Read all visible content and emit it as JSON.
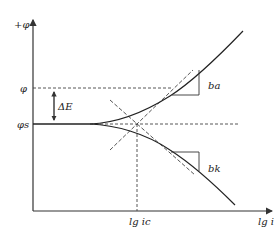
{
  "diagram": {
    "type": "polarization-curve (Tafel plot)",
    "y_axis": {
      "label": "+φ"
    },
    "x_axis": {
      "label": "lg i"
    },
    "levels": {
      "phi": "φ",
      "phi_s": "φs",
      "delta": "ΔE"
    },
    "x_marker": "lg ic",
    "slopes": {
      "upper": "ba",
      "lower": "bk"
    }
  }
}
